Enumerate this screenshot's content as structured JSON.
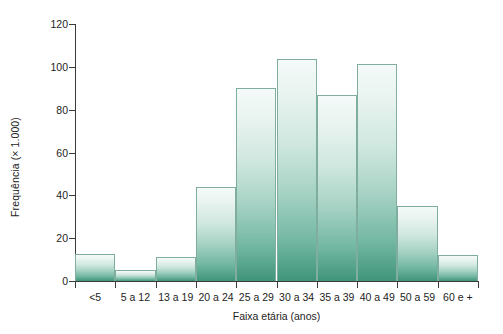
{
  "chart_data": {
    "type": "bar",
    "title": "",
    "subtitle": "",
    "xlabel": "Faixa etária (anos)",
    "ylabel": "Frequência (× 1.000)",
    "categories": [
      "<5",
      "5 a 12",
      "13 a 19",
      "20 a 24",
      "25 a 29",
      "30 a 34",
      "35 a 39",
      "40 a 49",
      "50 a 59",
      "60 e +"
    ],
    "values": [
      12.5,
      5,
      11,
      44,
      90,
      103.5,
      87,
      101.5,
      35,
      12
    ],
    "ylim": [
      0,
      120
    ],
    "yticks": [
      0,
      20,
      40,
      60,
      80,
      100,
      120
    ],
    "ytick_labels": [
      "0",
      "20",
      "40",
      "60",
      "80",
      "100",
      "120"
    ],
    "grid": false,
    "legend": false,
    "legend_position": "none",
    "bar_gradient_top": "#f4faf9",
    "bar_gradient_bottom": "#3f9479",
    "bar_border_color": "#7fae9f",
    "axis_color": "#3a3a3a",
    "text_color": "#1d1d1d",
    "background": "#ffffff"
  }
}
